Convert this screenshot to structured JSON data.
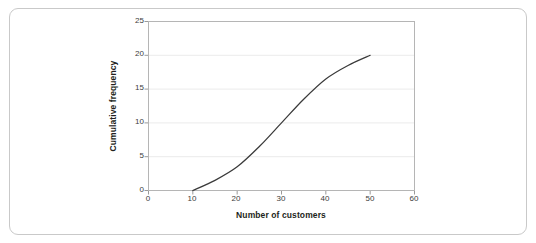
{
  "chart_data": {
    "type": "line",
    "title": "",
    "subtitle": "",
    "xlabel": "Number of customers",
    "ylabel": "Cumulative frequency",
    "xlim": [
      0,
      60
    ],
    "ylim": [
      0,
      25
    ],
    "xticks": [
      0,
      10,
      20,
      30,
      40,
      50,
      60
    ],
    "yticks": [
      0,
      5,
      10,
      15,
      20,
      25
    ],
    "grid": "horizontal",
    "legend": "none",
    "series": [
      {
        "name": "Cumulative frequency",
        "color": "#3a3a3a",
        "x": [
          10,
          15,
          20,
          25,
          30,
          35,
          40,
          45,
          50
        ],
        "values": [
          0,
          1.5,
          3.5,
          6.5,
          10,
          13.5,
          16.5,
          18.5,
          20
        ]
      }
    ]
  },
  "axes": {
    "y_title": "Cumulative frequency",
    "x_title": "Number of customers",
    "y_tick_labels": [
      "0",
      "5",
      "10",
      "15",
      "20",
      "25"
    ],
    "x_tick_labels": [
      "0",
      "10",
      "20",
      "30",
      "40",
      "50",
      "60"
    ]
  },
  "colors": {
    "frame_border": "#c9c9c9",
    "plot_border": "#b5b5b5",
    "gridline": "#ebebeb",
    "curve": "#3a3a3a",
    "tick_text": "#3d3d3d",
    "title_text": "#231f20"
  }
}
